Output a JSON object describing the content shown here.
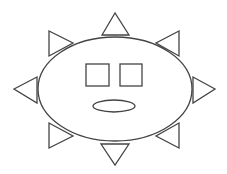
{
  "figure": {
    "stroke_color": "#444444",
    "fill_color": "#ffffff",
    "body": {
      "cx": 115,
      "cy": 89,
      "rx": 77,
      "ry": 52
    },
    "eyes": [
      {
        "name": "left-eye",
        "x": 86,
        "y": 64,
        "w": 23,
        "h": 22
      },
      {
        "name": "right-eye",
        "x": 120,
        "y": 64,
        "w": 22,
        "h": 22
      }
    ],
    "mouth": {
      "cx": 114,
      "cy": 106,
      "rx": 21,
      "ry": 6
    },
    "rays": [
      {
        "name": "ray-top",
        "points": "115,13 102,35 129,35"
      },
      {
        "name": "ray-bottom",
        "points": "101,144 129,144 115,165"
      },
      {
        "name": "ray-left",
        "points": "14,89 37,77 37,103"
      },
      {
        "name": "ray-right",
        "points": "193,77 193,103 215,89"
      },
      {
        "name": "ray-top-left",
        "points": "49,31 49,56 73,43"
      },
      {
        "name": "ray-top-right",
        "points": "179,31 179,56 156,43"
      },
      {
        "name": "ray-bottom-left",
        "points": "49,123 49,148 73,136"
      },
      {
        "name": "ray-bottom-right",
        "points": "179,123 179,148 156,136"
      }
    ]
  }
}
